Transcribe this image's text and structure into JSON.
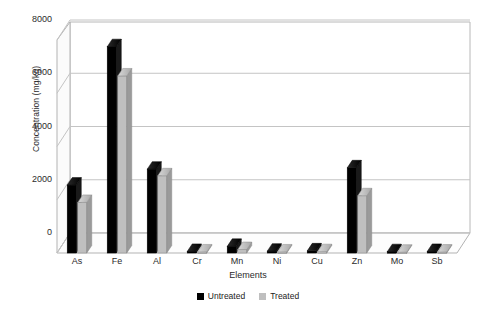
{
  "chart_data": {
    "type": "bar",
    "title": "",
    "xlabel": "Elements",
    "ylabel": "Concentration (mg/kg)",
    "categories": [
      "As",
      "Fe",
      "Al",
      "Cr",
      "Mn",
      "Ni",
      "Cu",
      "Zn",
      "Mo",
      "Sb"
    ],
    "series": [
      {
        "name": "Untreated",
        "color": "#000000",
        "values": [
          2550,
          7750,
          3150,
          60,
          250,
          70,
          80,
          3200,
          50,
          60
        ]
      },
      {
        "name": "Treated",
        "color": "#bfbfbf",
        "values": [
          1900,
          6650,
          2900,
          40,
          130,
          40,
          50,
          2150,
          30,
          35
        ]
      }
    ],
    "ylim": [
      0,
      8000
    ],
    "yticks": [
      0,
      2000,
      4000,
      6000,
      8000
    ],
    "ytick_labels": [
      "0",
      "2000",
      "4000",
      "6000",
      "8000"
    ],
    "grid": "horizontal",
    "legend_position": "bottom",
    "style": "3d-column"
  },
  "legend": {
    "items": [
      {
        "label": "Untreated",
        "swatch": "black-square-swatch"
      },
      {
        "label": "Treated",
        "swatch": "gray-square-swatch"
      }
    ]
  }
}
